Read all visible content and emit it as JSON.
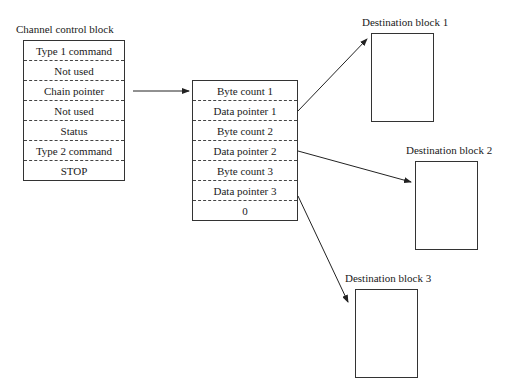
{
  "channel_control_block": {
    "title": "Channel control block",
    "rows": [
      "Type 1 command",
      "Not used",
      "Chain pointer",
      "Not used",
      "Status",
      "Type 2 command",
      "STOP"
    ]
  },
  "chain_list": {
    "rows": [
      "Byte count 1",
      "Data pointer 1",
      "Byte count 2",
      "Data pointer 2",
      "Byte count 3",
      "Data pointer 3",
      "0"
    ]
  },
  "destinations": [
    {
      "title": "Destination block 1"
    },
    {
      "title": "Destination block 2"
    },
    {
      "title": "Destination block 3"
    }
  ],
  "arrows": [
    {
      "from": "Chain pointer",
      "to": "chain list"
    },
    {
      "from": "Data pointer 1",
      "to": "Destination block 1"
    },
    {
      "from": "Data pointer 2",
      "to": "Destination block 2"
    },
    {
      "from": "Data pointer 3",
      "to": "Destination block 3"
    }
  ]
}
